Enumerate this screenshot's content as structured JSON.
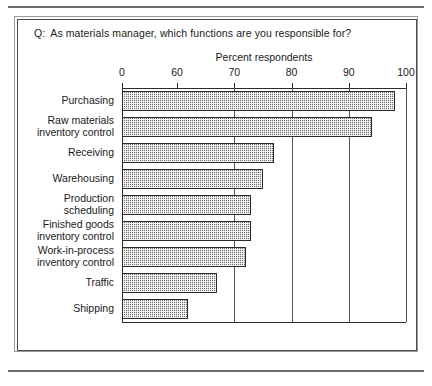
{
  "figure": {
    "question_prefix": "Q:",
    "question": "As materials manager, which functions are you responsible for?"
  },
  "chart_data": {
    "type": "bar",
    "orientation": "horizontal",
    "title": "",
    "xlabel": "Percent respondents",
    "ylabel": "",
    "xlim": [
      0,
      100
    ],
    "axis_break": true,
    "axis_break_note": "//",
    "xticks": [
      0,
      60,
      70,
      80,
      90,
      100
    ],
    "xticklabels": [
      "0",
      "60",
      "70",
      "80",
      "90",
      "100"
    ],
    "grid": "vertical gridlines at 70, 80, 90, 100",
    "legend": "none",
    "categories": [
      "Purchasing",
      "Raw materials\ninventory control",
      "Receiving",
      "Warehousing",
      "Production\nscheduling",
      "Finished goods\ninventory control",
      "Work-in-process\ninventory control",
      "Traffic",
      "Shipping"
    ],
    "values": [
      98,
      94,
      77,
      75,
      73,
      73,
      72,
      67,
      62
    ],
    "bar_fill": "#6e6e6e",
    "bar_edge": "#2b2b2b"
  }
}
